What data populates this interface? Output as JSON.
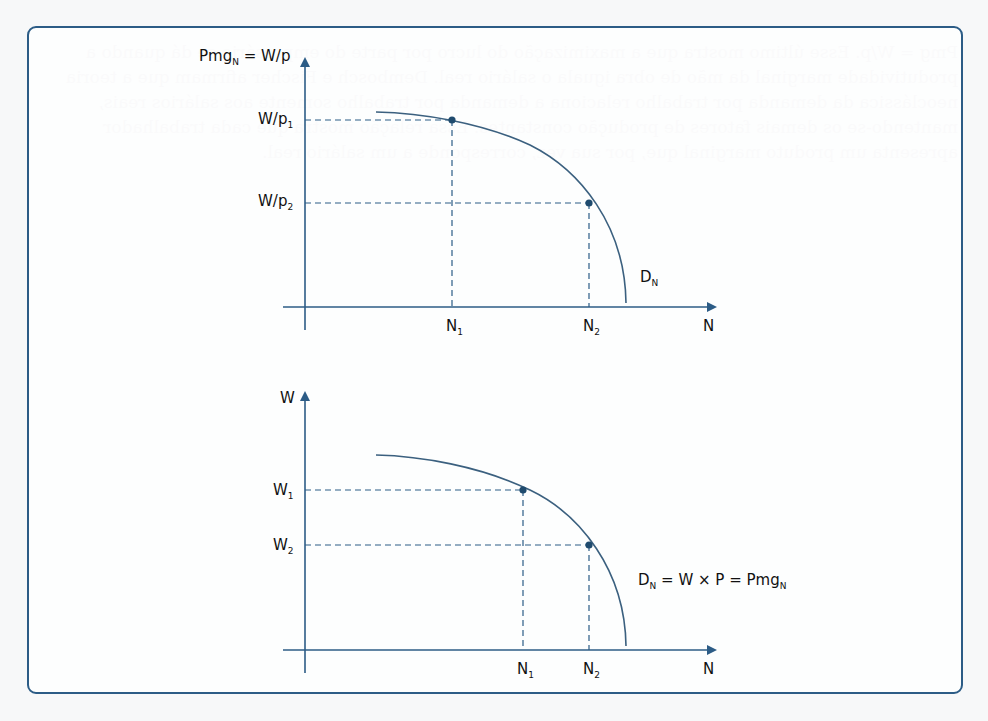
{
  "colors": {
    "axis": "#2c5c86",
    "curve": "#3b607f",
    "point": "#1f4b6e",
    "frame": "#2c5c86",
    "text": "#111111"
  },
  "top_chart": {
    "y_axis_label": "Pmg",
    "y_axis_label_sub": "N",
    "y_axis_label_rest": " = W/p",
    "x_axis_label": "N",
    "y_ticks": [
      {
        "base": "W/p",
        "sub": "1"
      },
      {
        "base": "W/p",
        "sub": "2"
      }
    ],
    "x_ticks": [
      {
        "base": "N",
        "sub": "1"
      },
      {
        "base": "N",
        "sub": "2"
      }
    ],
    "curve_label": {
      "base": "D",
      "sub": "N"
    }
  },
  "bottom_chart": {
    "y_axis_label": "W",
    "x_axis_label": "N",
    "y_ticks": [
      {
        "base": "W",
        "sub": "1"
      },
      {
        "base": "W",
        "sub": "2"
      }
    ],
    "x_ticks": [
      {
        "base": "N",
        "sub": "1"
      },
      {
        "base": "N",
        "sub": "2"
      }
    ],
    "curve_label": {
      "d": "D",
      "d_sub": "N",
      "mid": " = W × P = Pmg",
      "end_sub": "N"
    }
  },
  "background_text": "Pmg = W/p. Esse último mostra que a maximização do lucro por parte do empresário se dá quando a produtividade marginal da mão de obra iguala o salário real. Dembosch e Fischer afirmam que a teoria neoclássica da demanda por trabalho relaciona a demanda por trabalho somente aos salários reais, mantendo-se os demais fatores de produção constantes. Essa relação mostra que cada trabalhador apresenta um produto marginal que, por sua vez, corresponde a um salário real."
}
